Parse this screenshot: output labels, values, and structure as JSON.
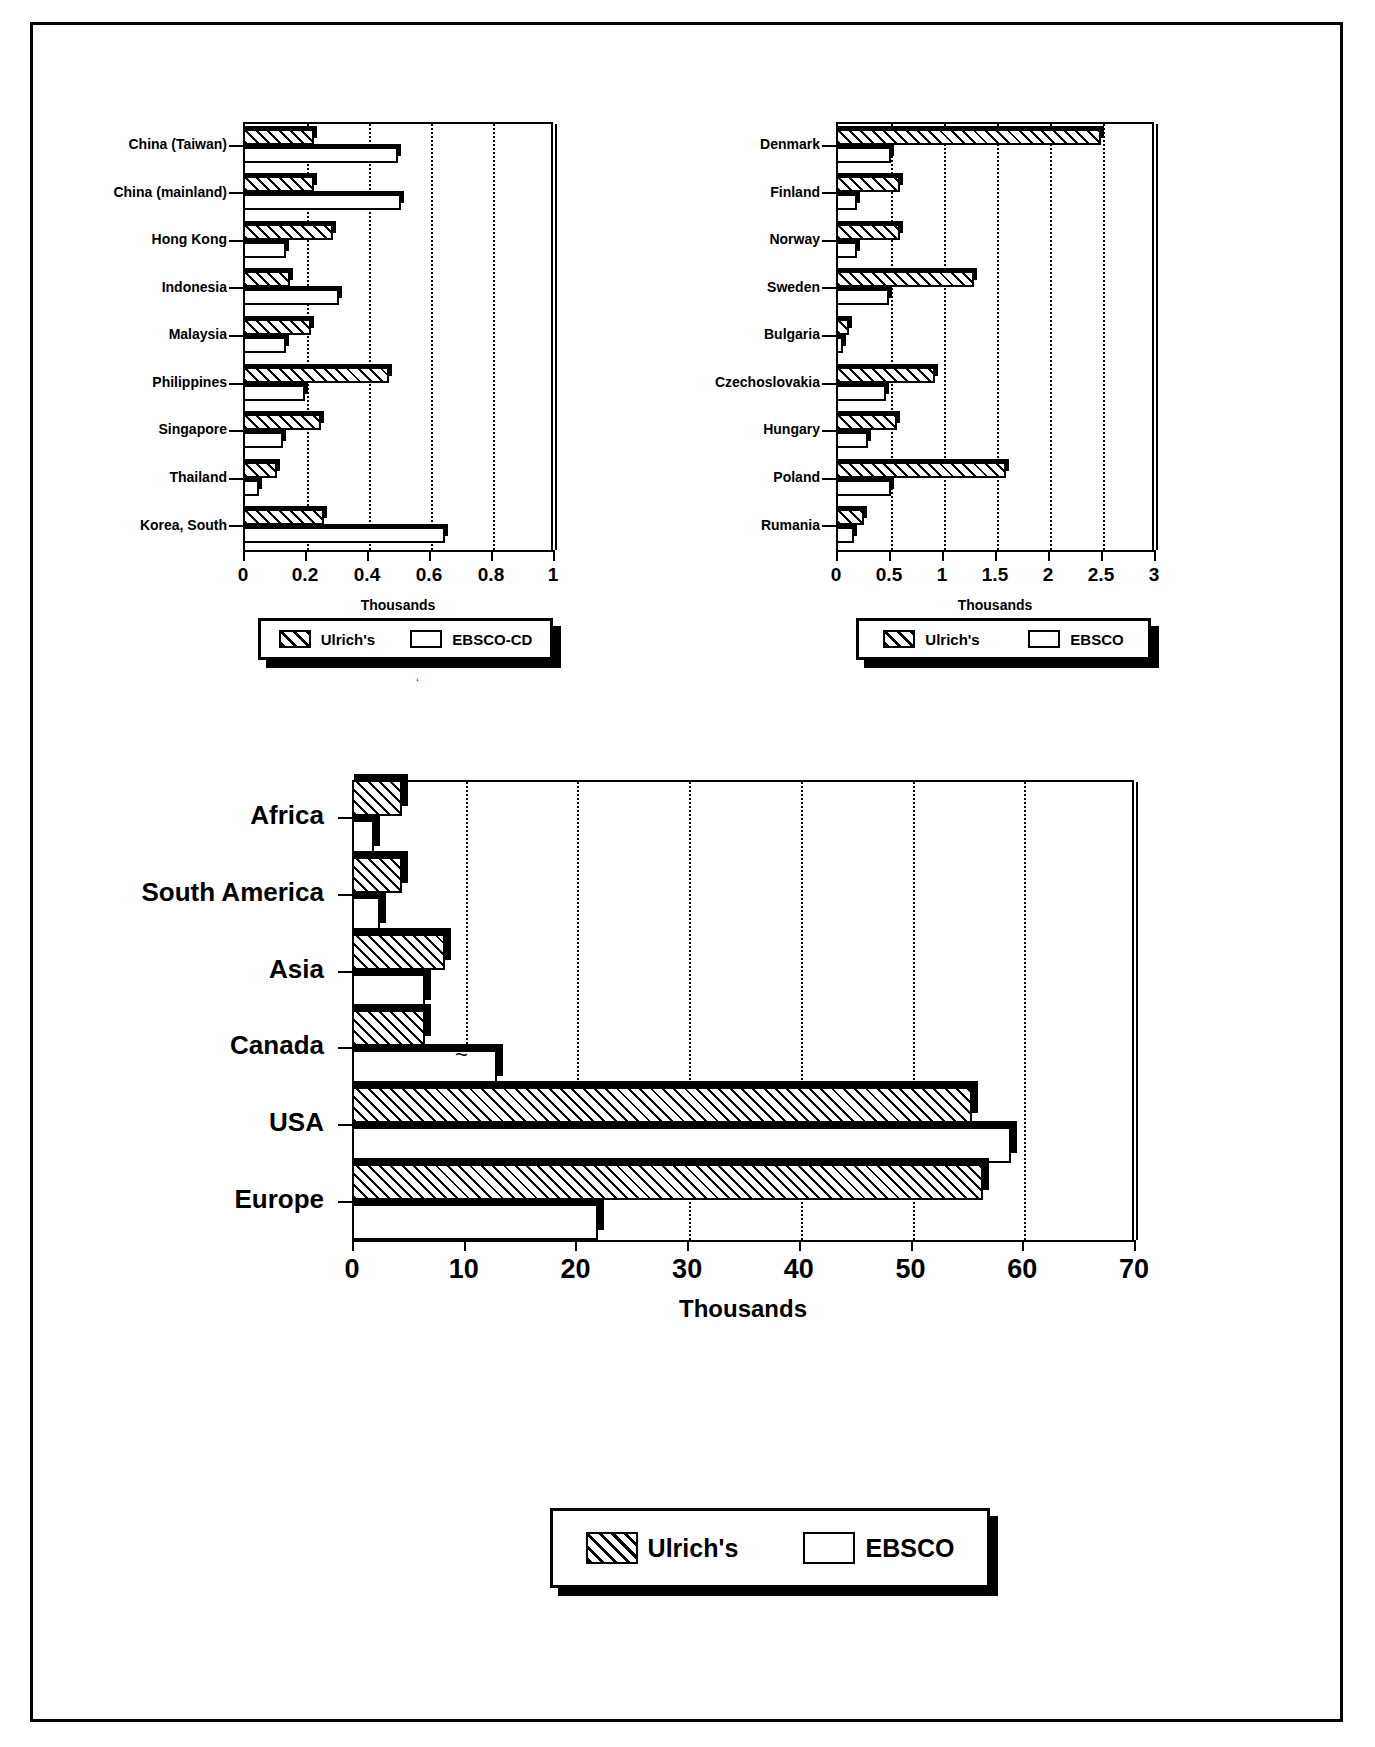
{
  "figure": {
    "background": "#ffffff",
    "frame_color": "#000000",
    "series_colors": {
      "ulrichs": "hatched-black-on-white",
      "ebsco": "white-with-black-outline"
    }
  },
  "charts": [
    {
      "id": "asia-chart",
      "position": "top-left",
      "axis_title": "Thousands",
      "xticks": [
        "0",
        "0.2",
        "0.4",
        "0.6",
        "0.8",
        "1"
      ],
      "legend": {
        "items": [
          {
            "label": "Ulrich's",
            "style": "hatch"
          },
          {
            "label": "EBSCO-CD",
            "style": "plain"
          }
        ]
      },
      "categories": [
        "China (Taiwan)",
        "China (mainland)",
        "Hong Kong",
        "Indonesia",
        "Malaysia",
        "Philippines",
        "Singapore",
        "Thailand",
        "Korea, South"
      ]
    },
    {
      "id": "europe-chart",
      "position": "top-right",
      "axis_title": "Thousands",
      "xticks": [
        "0",
        "0.5",
        "1",
        "1.5",
        "2",
        "2.5",
        "3"
      ],
      "legend": {
        "items": [
          {
            "label": "Ulrich's",
            "style": "hatch"
          },
          {
            "label": "EBSCO",
            "style": "plain"
          }
        ]
      },
      "categories": [
        "Denmark",
        "Finland",
        "Norway",
        "Sweden",
        "Bulgaria",
        "Czechoslovakia",
        "Hungary",
        "Poland",
        "Rumania"
      ]
    },
    {
      "id": "world-chart",
      "position": "bottom",
      "axis_title": "Thousands",
      "xticks": [
        "0",
        "10",
        "20",
        "30",
        "40",
        "50",
        "60",
        "70"
      ],
      "legend": {
        "items": [
          {
            "label": "Ulrich's",
            "style": "hatch"
          },
          {
            "label": "EBSCO",
            "style": "plain"
          }
        ]
      },
      "categories": [
        "Africa",
        "South America",
        "Asia",
        "Canada",
        "USA",
        "Europe"
      ]
    }
  ],
  "chart_data": [
    {
      "type": "bar",
      "orientation": "horizontal",
      "title": "",
      "xlabel": "Thousands",
      "ylabel": "",
      "xlim": [
        0,
        1
      ],
      "xticks": [
        0,
        0.2,
        0.4,
        0.6,
        0.8,
        1
      ],
      "grid": "vertical-dotted",
      "legend_position": "below",
      "categories": [
        "China (Taiwan)",
        "China (mainland)",
        "Hong Kong",
        "Indonesia",
        "Malaysia",
        "Philippines",
        "Singapore",
        "Thailand",
        "Korea, South"
      ],
      "series": [
        {
          "name": "Ulrich's",
          "values": [
            0.23,
            0.23,
            0.29,
            0.15,
            0.22,
            0.47,
            0.25,
            0.11,
            0.26
          ]
        },
        {
          "name": "EBSCO-CD",
          "values": [
            0.5,
            0.51,
            0.14,
            0.31,
            0.14,
            0.2,
            0.13,
            0.05,
            0.65
          ]
        }
      ]
    },
    {
      "type": "bar",
      "orientation": "horizontal",
      "title": "",
      "xlabel": "Thousands",
      "ylabel": "",
      "xlim": [
        0,
        3
      ],
      "xticks": [
        0,
        0.5,
        1,
        1.5,
        2,
        2.5,
        3
      ],
      "grid": "vertical-dotted",
      "legend_position": "below",
      "categories": [
        "Denmark",
        "Finland",
        "Norway",
        "Sweden",
        "Bulgaria",
        "Czechoslovakia",
        "Hungary",
        "Poland",
        "Rumania"
      ],
      "series": [
        {
          "name": "Ulrich's",
          "values": [
            2.5,
            0.6,
            0.6,
            1.3,
            0.12,
            0.93,
            0.58,
            1.6,
            0.26
          ]
        },
        {
          "name": "EBSCO",
          "values": [
            0.52,
            0.2,
            0.2,
            0.5,
            0.07,
            0.47,
            0.3,
            0.52,
            0.17
          ]
        }
      ]
    },
    {
      "type": "bar",
      "orientation": "horizontal",
      "title": "",
      "xlabel": "Thousands",
      "ylabel": "",
      "xlim": [
        0,
        70
      ],
      "xticks": [
        0,
        10,
        20,
        30,
        40,
        50,
        60,
        70
      ],
      "grid": "vertical-dotted",
      "legend_position": "below",
      "categories": [
        "Africa",
        "South America",
        "Asia",
        "Canada",
        "USA",
        "Europe"
      ],
      "series": [
        {
          "name": "Ulrich's",
          "values": [
            4.5,
            4.5,
            8.3,
            6.5,
            55.5,
            56.5
          ]
        },
        {
          "name": "EBSCO",
          "values": [
            2.0,
            2.5,
            6.5,
            13.0,
            59.0,
            22.0
          ]
        }
      ]
    }
  ]
}
